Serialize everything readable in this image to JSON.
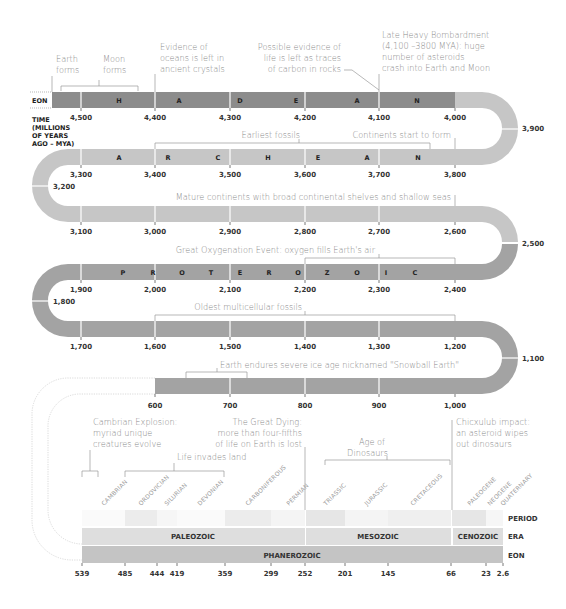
{
  "colors": {
    "hadean": "#8c8c8c",
    "archean": "#c6c6c6",
    "proterozoic": "#a3a3a3",
    "phanerozoic_eon": "#c4c4c4",
    "era_band": "#dedede",
    "period_band": "#ececec",
    "annotation_text": "#8a8a8a",
    "bracket": "#9a9a9a"
  },
  "side_labels": {
    "eon": "EON",
    "time_line1": "TIME",
    "time_line2": "(MILLIONS",
    "time_line3": "OF YEARS",
    "time_line4": "AGO – MYA)",
    "period": "PERIOD",
    "era": "ERA",
    "eon_bottom": "EON"
  },
  "eons": {
    "hadean_letters": [
      "H",
      "A",
      "D",
      "E",
      "A",
      "N"
    ],
    "archean_letters": [
      "A",
      "R",
      "C",
      "H",
      "E",
      "A",
      "N"
    ],
    "proterozoic_letters": [
      "P",
      "R",
      "O",
      "T",
      "E",
      "R",
      "O",
      "Z",
      "O",
      "I",
      "C"
    ]
  },
  "ticks": {
    "row1": [
      "4,500",
      "4,400",
      "4,300",
      "4,200",
      "4,100",
      "4,000"
    ],
    "turn1": "3,900",
    "row2": [
      "3,300",
      "3,400",
      "3,500",
      "3,600",
      "3,700",
      "3,800"
    ],
    "turn2": "3,200",
    "row3": [
      "3,100",
      "3,000",
      "2,900",
      "2,800",
      "2,700",
      "2,600"
    ],
    "turn3": "2,500",
    "row4": [
      "1,900",
      "2,000",
      "2,100",
      "2,200",
      "2,300",
      "2,400"
    ],
    "turn4": "1,800",
    "row5": [
      "1,700",
      "1,600",
      "1,500",
      "1,400",
      "1,300",
      "1,200"
    ],
    "turn5": "1,100",
    "row6": [
      "600",
      "700",
      "800",
      "900",
      "1,000"
    ],
    "bottom": [
      "539",
      "485",
      "444",
      "419",
      "359",
      "299",
      "252",
      "201",
      "145",
      "66",
      "23",
      "2.6"
    ]
  },
  "annotations": {
    "earth_forms": [
      "Earth",
      "forms"
    ],
    "moon_forms": [
      "Moon",
      "forms"
    ],
    "oceans": [
      "Evidence of",
      "oceans is left in",
      "ancient crystals"
    ],
    "life_carbon": [
      "Possible evidence of",
      "life is left as traces",
      "of carbon in rocks"
    ],
    "bombardment": [
      "Late Heavy Bombardment",
      "(4,100 –3800 MYA): huge",
      "number of asteroids",
      "crash into Earth and Moon"
    ],
    "earliest_fossils": "Earliest fossils",
    "continents_form": "Continents start to form",
    "mature_continents": "Mature continents with broad continental shelves and shallow seas",
    "oxygenation": "Great Oxygenation Event: oxygen fills Earth's air",
    "multicellular": "Oldest multicellular fossils",
    "snowball": "Earth endures severe ice age nicknamed \"Snowball Earth\"",
    "cambrian_explosion": [
      "Cambrian Explosion:",
      "myriad unique",
      "creatures evolve"
    ],
    "great_dying": [
      "The Great Dying:",
      "more than four-fifths",
      "of life on Earth is lost"
    ],
    "life_land": "Life invades land",
    "age_dinosaurs": [
      "Age of",
      "Dinosaurs"
    ],
    "chicxulub": [
      "Chicxulub impact:",
      "an asteroid wipes",
      "out dinosaurs"
    ]
  },
  "periods": [
    "CAMBRIAN",
    "ORDOVICIAN",
    "SILURIAN",
    "DEVONIAN",
    "CARBONIFEROUS",
    "PERMIAN",
    "TRIASSIC",
    "JURASSIC",
    "CRETACEOUS",
    "PALEOGENE",
    "NEOGENE",
    "QUATERNARY"
  ],
  "eras": [
    "PALEOZOIC",
    "MESOZOIC",
    "CENOZOIC"
  ],
  "eon_bottom": "PHANEROZOIC"
}
